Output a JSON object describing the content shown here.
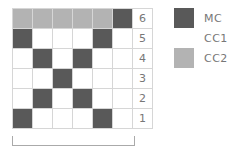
{
  "colors": {
    "MC": "#595959",
    "CC1": "#ffffff",
    "CC2": "#b3b3b3"
  },
  "chart": {
    "rows": [
      {
        "number": "6",
        "cells": [
          "CC2",
          "CC2",
          "CC2",
          "CC2",
          "CC2",
          "MC"
        ]
      },
      {
        "number": "5",
        "cells": [
          "MC",
          "CC1",
          "CC1",
          "CC1",
          "MC",
          "CC1"
        ]
      },
      {
        "number": "4",
        "cells": [
          "CC1",
          "MC",
          "CC1",
          "MC",
          "CC1",
          "CC1"
        ]
      },
      {
        "number": "3",
        "cells": [
          "CC1",
          "CC1",
          "MC",
          "CC1",
          "CC1",
          "CC1"
        ]
      },
      {
        "number": "2",
        "cells": [
          "CC1",
          "MC",
          "CC1",
          "MC",
          "CC1",
          "CC1"
        ]
      },
      {
        "number": "1",
        "cells": [
          "MC",
          "CC1",
          "CC1",
          "CC1",
          "MC",
          "CC1"
        ]
      }
    ]
  },
  "legend": [
    {
      "key": "MC",
      "label": "MC"
    },
    {
      "key": "CC1",
      "label": "CC1"
    },
    {
      "key": "CC2",
      "label": "CC2"
    }
  ]
}
